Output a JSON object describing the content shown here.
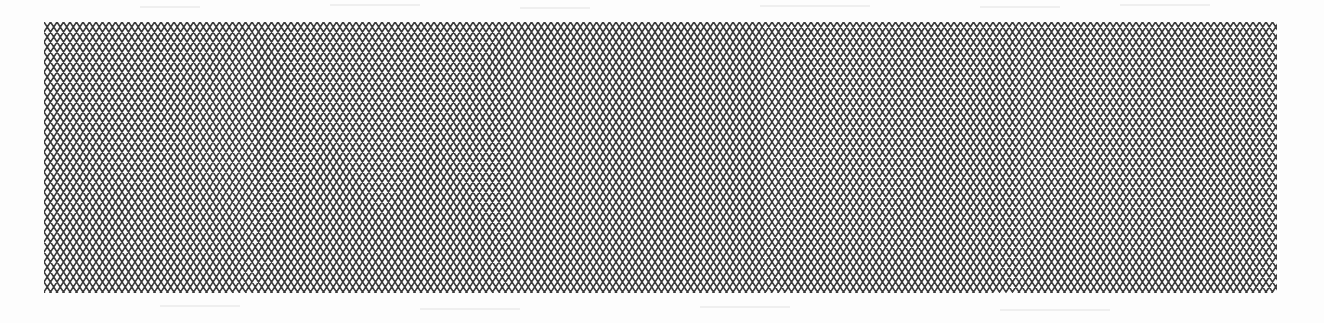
{
  "figure": {
    "type": "diamond-mesh-pattern",
    "pattern": {
      "cell_width_px": 13,
      "cell_height_px": 20,
      "columns": 95,
      "rows": 14,
      "stroke_color": "#3a3a3a",
      "stroke_width": 1.6,
      "background_color": "#fdfdfd"
    },
    "bounds": {
      "x": 44,
      "y": 22,
      "width": 1233,
      "height": 271
    }
  }
}
